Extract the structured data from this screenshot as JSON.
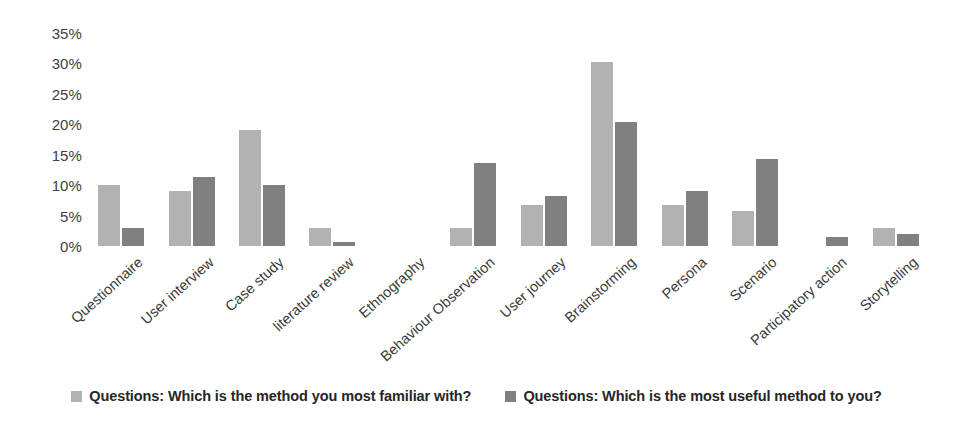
{
  "chart_data": {
    "type": "bar",
    "title": "",
    "subtitle": "",
    "xlabel": "",
    "ylabel": "",
    "ylim": [
      0,
      35
    ],
    "ytick_labels": [
      "35%",
      "30%",
      "25%",
      "20%",
      "15%",
      "10%",
      "5%",
      "0%"
    ],
    "ytick_values": [
      35,
      30,
      25,
      20,
      15,
      10,
      5,
      0
    ],
    "grid": false,
    "legend_position": "bottom",
    "categories": [
      "Questionnaire",
      "User interview",
      "Case study",
      "literature review",
      "Ethnography",
      "Behaviour Observation",
      "User journey",
      "Brainstorming",
      "Persona",
      "Scenario",
      "Participatory action",
      "Storytelling"
    ],
    "series": [
      {
        "name": "Questions: Which is the method you most familiar with?",
        "color": "#b2b2b2",
        "values": [
          10.0,
          9.0,
          19.0,
          3.0,
          0,
          3.0,
          6.7,
          30.2,
          6.7,
          5.7,
          0,
          3.0
        ]
      },
      {
        "name": "Questions: Which is the most useful method to you?",
        "color": "#808080",
        "values": [
          3.0,
          11.3,
          10.0,
          0.6,
          0,
          13.6,
          8.2,
          20.4,
          9.0,
          14.3,
          1.4,
          2.0
        ]
      }
    ]
  },
  "legend": {
    "items": [
      {
        "label": "Questions: Which is the method you most familiar with?",
        "color": "#b2b2b2"
      },
      {
        "label": "Questions: Which is the most useful method to you?",
        "color": "#808080"
      }
    ]
  },
  "colors": {
    "series_light": "#b2b2b2",
    "series_dark": "#808080",
    "text": "#3f3f3f",
    "background": "#ffffff"
  }
}
